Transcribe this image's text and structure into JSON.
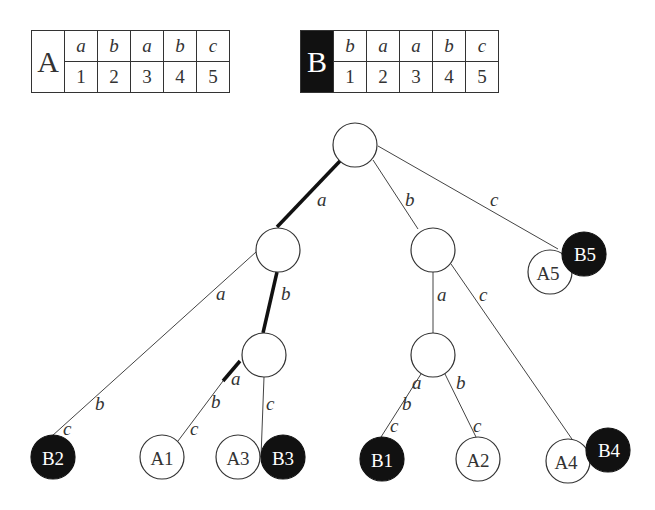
{
  "sequences": {
    "A": {
      "name": "A",
      "symbols": [
        "a",
        "b",
        "a",
        "b",
        "c"
      ],
      "positions": [
        "1",
        "2",
        "3",
        "4",
        "5"
      ],
      "style": "light"
    },
    "B": {
      "name": "B",
      "symbols": [
        "b",
        "a",
        "a",
        "b",
        "c"
      ],
      "positions": [
        "1",
        "2",
        "3",
        "4",
        "5"
      ],
      "style": "dark"
    }
  },
  "tree": {
    "edge_labels": {
      "root_a": "a",
      "root_b": "b",
      "root_c": "c",
      "n1_a": "a",
      "n1_b": "b",
      "n1_a_b": "b",
      "n1_a_c": "c",
      "n3_a": "a",
      "n3_a_b": "b",
      "n3_a_c": "c",
      "n3_c": "c",
      "n2_a": "a",
      "n2_c": "c",
      "n4_a": "a",
      "n4_a_b": "b",
      "n4_a_c": "c",
      "n4_b": "b",
      "n4_b_c": "c"
    },
    "leaves": {
      "B2": "B2",
      "A1": "A1",
      "A3": "A3",
      "B3": "B3",
      "B1": "B1",
      "A2": "A2",
      "A4": "A4",
      "B4": "B4",
      "A5": "A5",
      "B5": "B5"
    },
    "colors": {
      "suffix_A": "#ffffff",
      "suffix_B": "#111111",
      "highlight_path": "#111111"
    }
  }
}
